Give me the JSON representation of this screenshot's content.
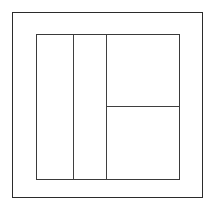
{
  "drawing": {
    "title": "Rectangular frame line drawing",
    "canvas": {
      "width": 215,
      "height": 205,
      "background_color": "#ffffff"
    },
    "colors": {
      "outer_stroke": "#2b2b2b",
      "inner_stroke": "#3a3a3a",
      "divider_stroke": "#3f3f3f",
      "fill": "#ffffff"
    },
    "outer_frame": {
      "label": "outer frame rectangle",
      "x": 12,
      "y": 12,
      "width": 191,
      "height": 186,
      "stroke_width": 1.4
    },
    "inner_rect": {
      "label": "inner rectangle",
      "x": 36,
      "y": 34,
      "width": 144,
      "height": 146,
      "stroke_width": 1.6
    },
    "vertical_dividers": [
      {
        "label": "first vertical divider",
        "x": 73,
        "y_top": 34,
        "y_bottom": 180
      },
      {
        "label": "second vertical divider",
        "x": 106,
        "y_top": 34,
        "y_bottom": 180
      }
    ],
    "horizontal_dividers": [
      {
        "label": "horizontal divider in right panel",
        "y": 106,
        "x_left": 106,
        "x_right": 180
      }
    ],
    "regions": [
      {
        "label": "left panel",
        "x": 36,
        "y": 34,
        "width": 37,
        "height": 146
      },
      {
        "label": "middle panel",
        "x": 73,
        "y": 34,
        "width": 33,
        "height": 146
      },
      {
        "label": "right upper panel",
        "x": 106,
        "y": 34,
        "width": 74,
        "height": 72
      },
      {
        "label": "right lower panel",
        "x": 106,
        "y": 106,
        "width": 74,
        "height": 74
      },
      {
        "label": "margin band",
        "x": 12,
        "y": 12,
        "width": 191,
        "height": 186
      }
    ]
  }
}
